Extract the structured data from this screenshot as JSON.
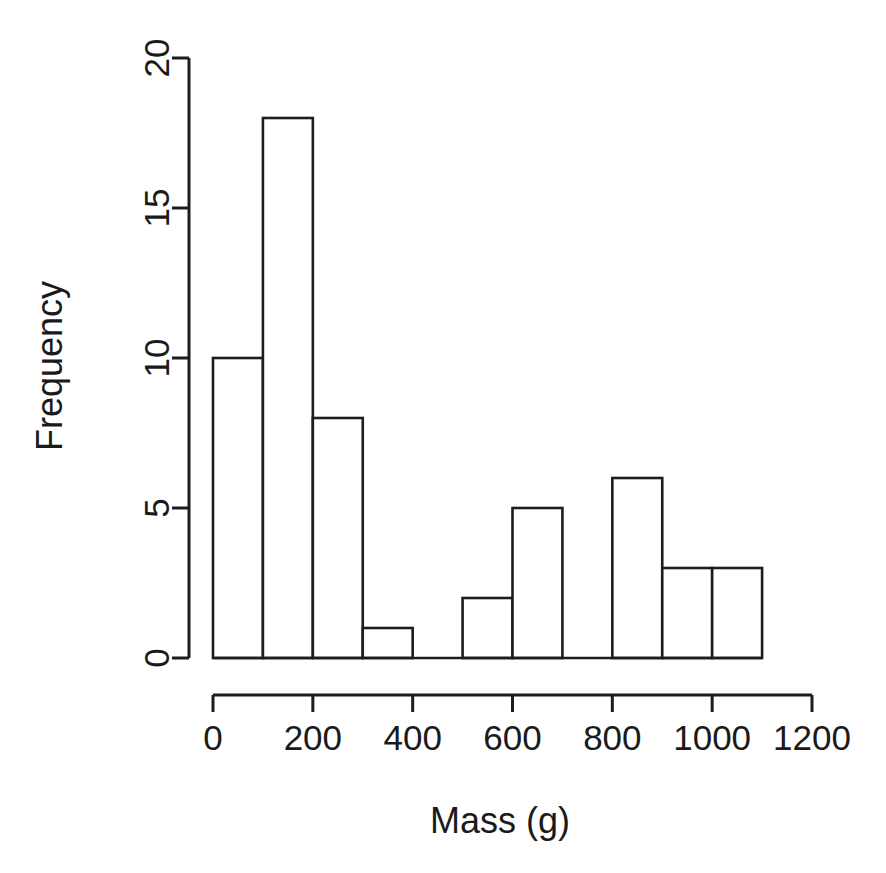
{
  "chart_data": {
    "type": "bar",
    "subtype": "histogram",
    "title": "",
    "subtitle": "",
    "xlabel": "Mass (g)",
    "ylabel": "Frequency",
    "bin_width": 100,
    "bin_edges": [
      0,
      100,
      200,
      300,
      400,
      500,
      600,
      700,
      800,
      900,
      1000,
      1100
    ],
    "categories": [
      "0-100",
      "100-200",
      "200-300",
      "300-400",
      "400-500",
      "500-600",
      "600-700",
      "700-800",
      "800-900",
      "900-1000",
      "1000-1100"
    ],
    "values": [
      10,
      18,
      8,
      1,
      0,
      2,
      5,
      0,
      6,
      3,
      3
    ],
    "bars": [
      {
        "x0": 0,
        "x1": 100,
        "value": 10
      },
      {
        "x0": 100,
        "x1": 200,
        "value": 18
      },
      {
        "x0": 200,
        "x1": 300,
        "value": 8
      },
      {
        "x0": 300,
        "x1": 400,
        "value": 1
      },
      {
        "x0": 400,
        "x1": 500,
        "value": 0
      },
      {
        "x0": 500,
        "x1": 600,
        "value": 2
      },
      {
        "x0": 600,
        "x1": 700,
        "value": 5
      },
      {
        "x0": 700,
        "x1": 800,
        "value": 0
      },
      {
        "x0": 800,
        "x1": 900,
        "value": 6
      },
      {
        "x0": 900,
        "x1": 1000,
        "value": 3
      },
      {
        "x0": 1000,
        "x1": 1100,
        "value": 3
      }
    ],
    "xlim": [
      0,
      1200
    ],
    "ylim": [
      0,
      20
    ],
    "xticks": [
      0,
      200,
      400,
      600,
      800,
      1000,
      1200
    ],
    "xtick_labels": [
      "0",
      "200",
      "400",
      "600",
      "800",
      "1000",
      "1200"
    ],
    "yticks": [
      0,
      5,
      10,
      15,
      20
    ],
    "ytick_labels": [
      "0",
      "5",
      "10",
      "15",
      "20"
    ],
    "grid": false,
    "legend": false,
    "total_count": 56,
    "colors": {
      "background": "#ffffff",
      "bar_fill": "#ffffff",
      "bar_stroke": "#1d1d1d",
      "axis": "#1d1d1d",
      "text": "#1a1a1a"
    }
  }
}
